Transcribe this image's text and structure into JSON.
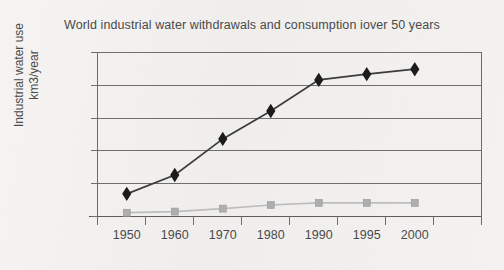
{
  "chart_data": {
    "type": "line",
    "title": "World industrial water withdrawals and consumption iover 50 years",
    "xlabel": "",
    "ylabel": "Industrial water use km3/year",
    "ylabel_line1": "Industrial water use",
    "ylabel_line2": "km3/year",
    "categories": [
      "1950",
      "1960",
      "1970",
      "1980",
      "1990",
      "1995",
      "2000"
    ],
    "x": [
      1950,
      1960,
      1970,
      1980,
      1990,
      1995,
      2000
    ],
    "ylim": [
      0,
      1000
    ],
    "ytick_labels": [
      "1000",
      "800",
      "600",
      "400",
      "200",
      "0"
    ],
    "ytick_values": [
      1000,
      800,
      600,
      400,
      200,
      0
    ],
    "grid": "horizontal",
    "legend": "none",
    "series": [
      {
        "name": "Industrial water withdrawals",
        "marker": "diamond",
        "color": "#1b1b1b",
        "values": [
          135,
          250,
          470,
          640,
          830,
          865,
          895
        ]
      },
      {
        "name": "Industrial water consumption",
        "marker": "square",
        "color": "#aeaeae",
        "values": [
          20,
          27,
          45,
          67,
          80,
          80,
          80
        ]
      }
    ]
  },
  "colors": {
    "background": "#f2f1ef",
    "axis": "#6e6e6e",
    "text": "#4a4a4a",
    "series_withdrawals": "#1b1b1b",
    "series_consumption": "#aeaeae"
  }
}
